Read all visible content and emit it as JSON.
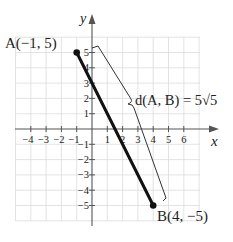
{
  "diagram": {
    "type": "coordinate-plane",
    "axes": {
      "x_label": "x",
      "y_label": "y",
      "x_ticks": [
        "−4",
        "−3",
        "−2",
        "−1",
        "1",
        "2",
        "3",
        "4",
        "5",
        "6"
      ],
      "y_ticks": [
        "5",
        "4",
        "3",
        "2",
        "1",
        "−1",
        "−2",
        "−3",
        "−4",
        "−5"
      ],
      "grid_range": {
        "x": [
          -5,
          7
        ],
        "y": [
          -6,
          6
        ]
      }
    },
    "points": [
      {
        "name": "A",
        "label": "A(−1, 5)",
        "x": -1,
        "y": 5
      },
      {
        "name": "B",
        "label": "B(4, −5)",
        "x": 4,
        "y": -5
      }
    ],
    "segment": {
      "from": "A",
      "to": "B"
    },
    "annotation": {
      "label": "d(A, B) = 5√5"
    },
    "colors": {
      "grid": "#d9d9d9",
      "axis": "#555555",
      "segment": "#111111"
    }
  }
}
